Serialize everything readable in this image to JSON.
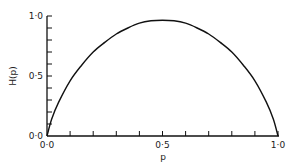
{
  "chart_data": {
    "type": "line",
    "title": "",
    "xlabel": "p",
    "ylabel": "H(p)",
    "xlim": [
      0.0,
      1.0
    ],
    "ylim": [
      0.0,
      1.0
    ],
    "grid": false,
    "x_ticks": [
      {
        "value": 0.0,
        "label": "0·0"
      },
      {
        "value": 0.5,
        "label": "0·5"
      },
      {
        "value": 1.0,
        "label": "1·0"
      }
    ],
    "y_ticks": [
      {
        "value": 0.0,
        "label": "0·0"
      },
      {
        "value": 0.5,
        "label": "0·5"
      },
      {
        "value": 1.0,
        "label": "1·0"
      }
    ],
    "minor_tick_step": 0.1,
    "series": [
      {
        "name": "H(p)",
        "x": [
          0.0,
          0.02,
          0.05,
          0.1,
          0.15,
          0.2,
          0.25,
          0.3,
          0.35,
          0.4,
          0.45,
          0.5,
          0.55,
          0.6,
          0.65,
          0.7,
          0.75,
          0.8,
          0.85,
          0.9,
          0.95,
          0.98,
          1.0
        ],
        "values": [
          0.0,
          0.14,
          0.28,
          0.46,
          0.59,
          0.7,
          0.78,
          0.85,
          0.9,
          0.94,
          0.96,
          0.965,
          0.96,
          0.94,
          0.9,
          0.85,
          0.78,
          0.7,
          0.59,
          0.46,
          0.28,
          0.14,
          0.0
        ]
      }
    ]
  }
}
